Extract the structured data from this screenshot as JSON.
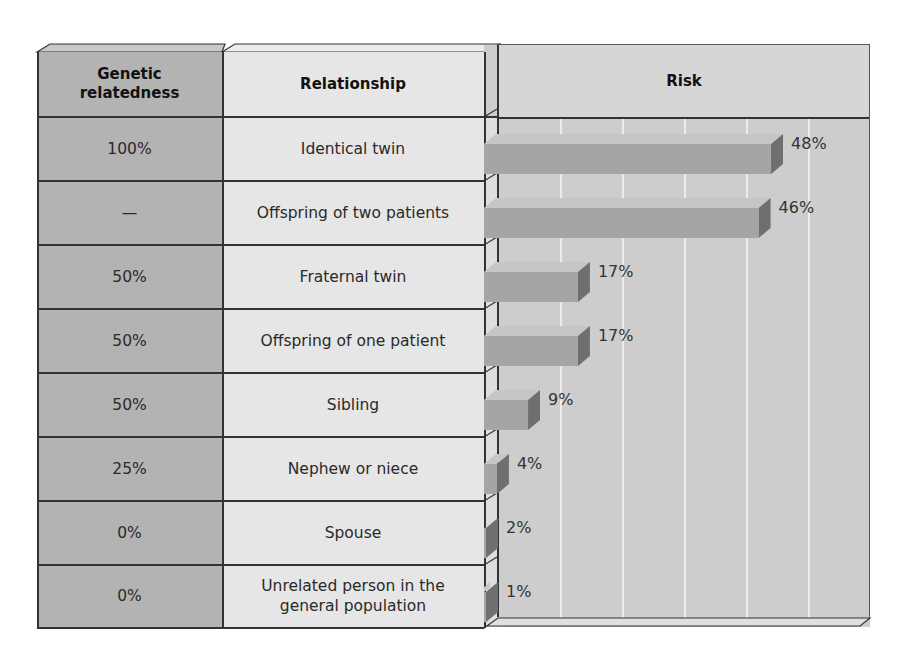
{
  "table": {
    "headers": {
      "genetic_relatedness": "Genetic relatedness",
      "genetic_relatedness_line1": "Genetic",
      "genetic_relatedness_line2": "relatedness",
      "relationship": "Relationship",
      "risk": "Risk"
    },
    "rows": [
      {
        "relatedness": "100%",
        "relationship": "Identical twin",
        "risk_label": "48%"
      },
      {
        "relatedness": "—",
        "relationship": "Offspring of two patients",
        "risk_label": "46%"
      },
      {
        "relatedness": "50%",
        "relationship": "Fraternal twin",
        "risk_label": "17%"
      },
      {
        "relatedness": "50%",
        "relationship": "Offspring of one patient",
        "risk_label": "17%"
      },
      {
        "relatedness": "50%",
        "relationship": "Sibling",
        "risk_label": "9%"
      },
      {
        "relatedness": "25%",
        "relationship": "Nephew or niece",
        "risk_label": "4%"
      },
      {
        "relatedness": "0%",
        "relationship": "Spouse",
        "risk_label": "2%"
      },
      {
        "relatedness": "0%",
        "relationship": "Unrelated person in the general population",
        "relationship_line1": "Unrelated person in the",
        "relationship_line2": "general population",
        "risk_label": "1%"
      }
    ]
  },
  "colors": {
    "relatedness_column": "#b3b3b3",
    "relationship_column": "#e6e6e6",
    "risk_panel": "#cdcdcd",
    "bar_front": "#a5a5a5",
    "bar_side": "#6f6f6f"
  },
  "chart_data": {
    "type": "bar",
    "orientation": "horizontal",
    "title": "Risk",
    "categories": [
      "Identical twin",
      "Offspring of two patients",
      "Fraternal twin",
      "Offspring of one patient",
      "Sibling",
      "Nephew or niece",
      "Spouse",
      "Unrelated person in the general population"
    ],
    "genetic_relatedness": [
      "100%",
      "—",
      "50%",
      "50%",
      "50%",
      "25%",
      "0%",
      "0%"
    ],
    "values": [
      48,
      46,
      17,
      17,
      9,
      4,
      2,
      1
    ],
    "value_labels": [
      "48%",
      "46%",
      "17%",
      "17%",
      "9%",
      "4%",
      "2%",
      "1%"
    ],
    "xlabel": "",
    "ylabel": "",
    "xlim": [
      0,
      60
    ],
    "grid": true,
    "gridline_interval": 10,
    "style": "3d"
  }
}
